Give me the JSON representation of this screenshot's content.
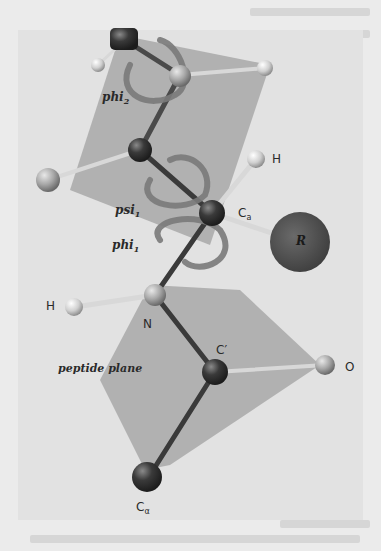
{
  "figure": {
    "labels": {
      "phi2": "phi",
      "phi2_sub": "2",
      "psi1": "psi",
      "psi1_sub": "1",
      "phi1": "phi",
      "phi1_sub": "1",
      "h_top": "H",
      "calpha_mid": "C",
      "calpha_mid_sub": "a",
      "r_group": "R",
      "h_left": "H",
      "n_atom": "N",
      "c_prime": "C′",
      "o_atom": "O",
      "peptide_plane": "peptide plane",
      "calpha_bottom": "C",
      "calpha_bottom_sub": "α"
    },
    "colors": {
      "background": "#ebebeb",
      "plane": "#a9a9a9",
      "dark_atom": "#2e2e2e",
      "light_atom": "#cfcfcf",
      "r_group": "#5a5a5a",
      "text": "#2a2a2a"
    }
  }
}
